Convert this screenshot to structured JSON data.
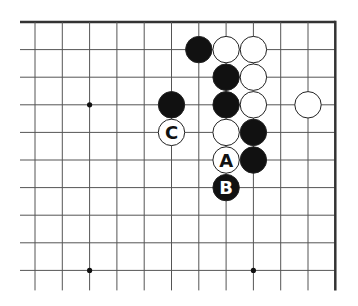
{
  "diagram": {
    "type": "go-board-fragment",
    "colors": {
      "background": "#ffffff",
      "line": "#555555",
      "edge": "#333333",
      "black_stone": "#111111",
      "white_stone": "#ffffff",
      "stone_outline": "#222222"
    },
    "grid": {
      "origin_x": 35,
      "origin_y": 22,
      "spacing_x": 27.3,
      "spacing_y": 27.6,
      "columns": 12,
      "rows": 10,
      "left_overhang": 15,
      "bottom_overhang": 20,
      "top_edge": true,
      "right_edge": true
    },
    "star_points": [
      {
        "col": 2,
        "row": 3
      },
      {
        "col": 2,
        "row": 9
      },
      {
        "col": 8,
        "row": 9
      }
    ],
    "stones": [
      {
        "col": 6,
        "row": 1,
        "color": "black",
        "label": ""
      },
      {
        "col": 7,
        "row": 1,
        "color": "white",
        "label": ""
      },
      {
        "col": 8,
        "row": 1,
        "color": "white",
        "label": ""
      },
      {
        "col": 7,
        "row": 2,
        "color": "black",
        "label": ""
      },
      {
        "col": 8,
        "row": 2,
        "color": "white",
        "label": ""
      },
      {
        "col": 5,
        "row": 3,
        "color": "black",
        "label": ""
      },
      {
        "col": 7,
        "row": 3,
        "color": "black",
        "label": ""
      },
      {
        "col": 8,
        "row": 3,
        "color": "white",
        "label": ""
      },
      {
        "col": 10,
        "row": 3,
        "color": "white",
        "label": ""
      },
      {
        "col": 5,
        "row": 4,
        "color": "white",
        "label": "C"
      },
      {
        "col": 7,
        "row": 4,
        "color": "white",
        "label": ""
      },
      {
        "col": 8,
        "row": 4,
        "color": "black",
        "label": ""
      },
      {
        "col": 7,
        "row": 5,
        "color": "white",
        "label": "A"
      },
      {
        "col": 8,
        "row": 5,
        "color": "black",
        "label": ""
      },
      {
        "col": 7,
        "row": 6,
        "color": "black",
        "label": "B"
      }
    ]
  }
}
